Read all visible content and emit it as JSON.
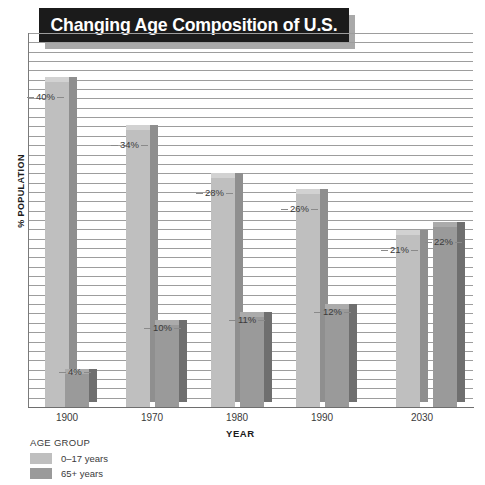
{
  "chart_data": {
    "type": "bar",
    "title": "Changing Age Composition of U.S.",
    "xlabel": "YEAR",
    "ylabel": "% POPULATION",
    "categories": [
      "1900",
      "1970",
      "1980",
      "1990",
      "2030"
    ],
    "ylim": [
      0,
      45
    ],
    "grid": true,
    "legend_position": "below-left",
    "legend_title": "AGE GROUP",
    "series": [
      {
        "name": "0–17 years",
        "color": "#bfbfbf",
        "values": [
          40,
          34,
          28,
          26,
          21
        ],
        "labels": [
          "40%",
          "34%",
          "28%",
          "26%",
          "21%"
        ]
      },
      {
        "name": "65+ years",
        "color": "#9a9a9a",
        "values": [
          4,
          10,
          11,
          12,
          22
        ],
        "labels": [
          "4%",
          "10%",
          "11%",
          "12%",
          "22%"
        ]
      }
    ]
  },
  "legend": {
    "title": "AGE GROUP",
    "items": [
      {
        "label": "0–17 years",
        "color": "#bfbfbf"
      },
      {
        "label": "65+ years",
        "color": "#9a9a9a"
      }
    ]
  },
  "axes": {
    "x_title": "YEAR",
    "y_title": "% POPULATION",
    "year_labels": [
      "1900",
      "1970",
      "1980",
      "1990",
      "2030"
    ]
  },
  "bar_labels": {
    "y1900_light": "40%",
    "y1900_dark": "4%",
    "y1970_light": "34%",
    "y1970_dark": "10%",
    "y1980_light": "28%",
    "y1980_dark": "11%",
    "y1990_light": "26%",
    "y1990_dark": "12%",
    "y2030_light": "21%",
    "y2030_dark": "22%"
  },
  "title": {
    "text": "Changing Age Composition of U.S."
  }
}
